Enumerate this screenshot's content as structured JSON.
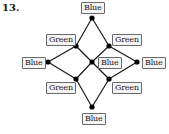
{
  "problem_number": "13.",
  "nodes": [
    {
      "id": "top",
      "x": 92,
      "y": 18,
      "label": "Blue",
      "lx": 81,
      "ly": 2
    },
    {
      "id": "upper-left",
      "x": 76,
      "y": 46,
      "label": "Green",
      "lx": 46,
      "ly": 34
    },
    {
      "id": "upper-right",
      "x": 109,
      "y": 46,
      "label": "Green",
      "lx": 112,
      "ly": 34
    },
    {
      "id": "left",
      "x": 48,
      "y": 62,
      "label": "Blue",
      "lx": 22,
      "ly": 57
    },
    {
      "id": "center",
      "x": 92,
      "y": 62,
      "label": "Blue",
      "lx": 98,
      "ly": 57
    },
    {
      "id": "right",
      "x": 137,
      "y": 62,
      "label": "Blue",
      "lx": 142,
      "ly": 57
    },
    {
      "id": "lower-left",
      "x": 76,
      "y": 79,
      "label": "Green",
      "lx": 46,
      "ly": 82
    },
    {
      "id": "lower-right",
      "x": 109,
      "y": 79,
      "label": "Green",
      "lx": 112,
      "ly": 82
    },
    {
      "id": "bottom",
      "x": 92,
      "y": 107,
      "label": "Blue",
      "lx": 82,
      "ly": 113
    }
  ],
  "edges": [
    [
      "top",
      "upper-left"
    ],
    [
      "top",
      "upper-right"
    ],
    [
      "upper-left",
      "left"
    ],
    [
      "upper-left",
      "center"
    ],
    [
      "upper-right",
      "center"
    ],
    [
      "upper-right",
      "right"
    ],
    [
      "left",
      "lower-left"
    ],
    [
      "center",
      "lower-left"
    ],
    [
      "center",
      "lower-right"
    ],
    [
      "right",
      "lower-right"
    ],
    [
      "lower-left",
      "bottom"
    ],
    [
      "lower-right",
      "bottom"
    ]
  ],
  "colors": {
    "edge": "#1a1a1a",
    "node": "#000000",
    "label_border": "#6a6a6a",
    "label_fill": "#f4f4f4"
  }
}
